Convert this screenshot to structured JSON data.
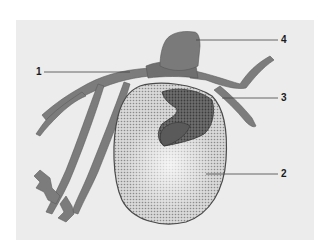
{
  "figure": {
    "panel_color": "#ececec",
    "callouts": [
      {
        "number": "1",
        "x": 36,
        "y": 68
      },
      {
        "number": "2",
        "x": 281,
        "y": 170
      },
      {
        "number": "3",
        "x": 281,
        "y": 94
      },
      {
        "number": "4",
        "x": 281,
        "y": 36
      }
    ]
  }
}
